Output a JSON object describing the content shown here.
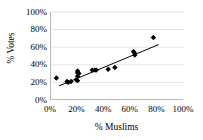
{
  "chart_data": {
    "type": "scatter",
    "title": "",
    "xlabel": "% Muslims",
    "ylabel": "% Votes",
    "xlim": [
      0,
      100
    ],
    "ylim": [
      0,
      100
    ],
    "xticks": [
      "0%",
      "20%",
      "40%",
      "60%",
      "80%",
      "100%"
    ],
    "yticks": [
      "0%",
      "20%",
      "40%",
      "60%",
      "80%",
      "100%"
    ],
    "xtick_values": [
      0,
      20,
      40,
      60,
      80,
      100
    ],
    "ytick_values": [
      0,
      20,
      40,
      60,
      80,
      100
    ],
    "grid": "horizontal",
    "legend": "none",
    "marker_style": "filled-diamond",
    "marker_color": "#000000",
    "trendline_color": "#000000",
    "gridline_color": "#d9d9d9",
    "axis_color": "#b8b8b8",
    "points": [
      {
        "x": 4,
        "y": 25
      },
      {
        "x": 12,
        "y": 21
      },
      {
        "x": 13,
        "y": 20
      },
      {
        "x": 15,
        "y": 21
      },
      {
        "x": 19,
        "y": 23
      },
      {
        "x": 20,
        "y": 33
      },
      {
        "x": 20,
        "y": 31
      },
      {
        "x": 20,
        "y": 27
      },
      {
        "x": 20,
        "y": 22
      },
      {
        "x": 21,
        "y": 30
      },
      {
        "x": 31,
        "y": 34
      },
      {
        "x": 33,
        "y": 34
      },
      {
        "x": 34,
        "y": 34
      },
      {
        "x": 43,
        "y": 35
      },
      {
        "x": 48,
        "y": 37
      },
      {
        "x": 62,
        "y": 55
      },
      {
        "x": 63,
        "y": 53
      },
      {
        "x": 63,
        "y": 51
      },
      {
        "x": 77,
        "y": 71
      }
    ],
    "trendline": {
      "x0": 6,
      "y0": 16,
      "x1": 81,
      "y1": 63
    }
  }
}
